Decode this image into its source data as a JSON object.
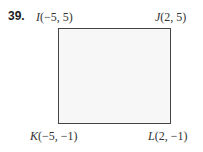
{
  "problem_number": "39.",
  "vertices": [
    {
      "name": "I",
      "coords": "(−5, 5)"
    },
    {
      "name": "J",
      "coords": "(2, 5)"
    },
    {
      "name": "K",
      "coords": "(−5, −1)"
    },
    {
      "name": "L",
      "coords": "(2, −1)"
    }
  ],
  "shape": "rectangle"
}
